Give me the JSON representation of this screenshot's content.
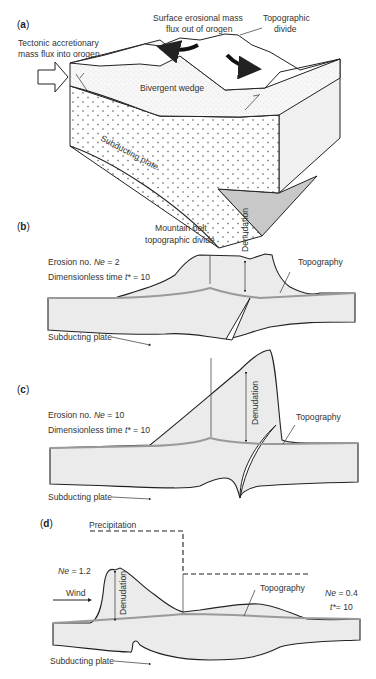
{
  "figure": {
    "panels": [
      {
        "id": "a",
        "label": "a",
        "labels": {
          "tectonic_flux_line1": "Tectonic accretionary",
          "tectonic_flux_line2": "mass flux into orogen",
          "erosion_flux_line1": "Surface erosional mass",
          "erosion_flux_line2": "flux out of orogen",
          "divide_line1": "Topographic",
          "divide_line2": "divide",
          "wedge": "Bivergent wedge",
          "plate": "Subducting plate"
        }
      },
      {
        "id": "b",
        "label": "b",
        "labels": {
          "divide_line1": "Mountain belt",
          "divide_line2": "topographic divide",
          "denudation": "Denudation",
          "erosion_prefix": "Erosion no. ",
          "erosion_var": "Ne",
          "erosion_value": " = 2",
          "time_prefix": "Dimensionless time ",
          "time_var": "t*",
          "time_value": " = 10",
          "topography": "Topography",
          "plate": "Subducting plate"
        }
      },
      {
        "id": "c",
        "label": "c",
        "labels": {
          "denudation": "Denudation",
          "erosion_prefix": "Erosion no. ",
          "erosion_var": "Ne",
          "erosion_value": " = 10",
          "time_prefix": "Dimensionless time ",
          "time_var": "t*",
          "time_value": " = 10",
          "topography": "Topography",
          "plate": "Subducting plate"
        }
      },
      {
        "id": "d",
        "label": "d",
        "labels": {
          "precipitation": "Precipitation",
          "ne_left_var": "Ne",
          "ne_left_value": " = 1.2",
          "wind": "Wind",
          "denudation": "Denudation",
          "topography": "Topography",
          "ne_right_var": "Ne",
          "ne_right_value": " = 0.4",
          "time_var": "t*",
          "time_value": "= 10",
          "plate": "Subducting plate"
        }
      }
    ],
    "colors": {
      "line": "#222222",
      "fill_gray": "#ebebeb",
      "topography_line": "#9a9a9a",
      "shaded_face": "#c8c8c8",
      "side_face": "#f0f0f0"
    }
  }
}
